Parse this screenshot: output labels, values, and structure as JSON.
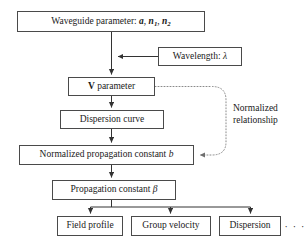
{
  "diagram": {
    "colors": {
      "background": "#ffffff",
      "border": "#4a4a4a",
      "text": "#1a1a1a",
      "edge": "#333333",
      "dotted_edge": "#8a8a8a"
    },
    "nodes": {
      "waveguide": {
        "label": "Waveguide parameter: a, n1, n2",
        "prefix": "Waveguide parameter: ",
        "sym_a": "a",
        "sym_n": "n",
        "sub1": "1",
        "sub2": "2",
        "comma": ", "
      },
      "wavelength": {
        "prefix": "Wavelength: ",
        "symbol": "λ"
      },
      "vparam": {
        "bold": "V",
        "rest": " parameter"
      },
      "dispersion_curve": {
        "label": "Dispersion curve"
      },
      "normalized_propagation": {
        "prefix": "Normalized propagation constant ",
        "symbol": "b"
      },
      "propagation_constant": {
        "prefix": "Propagation constant ",
        "symbol": "β"
      },
      "field_profile": {
        "label": "Field profile"
      },
      "group_velocity": {
        "label": "Group velocity"
      },
      "dispersion": {
        "label": "Dispersion"
      }
    },
    "annotations": {
      "normalized_relationship_line1": "Normalized",
      "normalized_relationship_line2": "relationship",
      "ellipsis": "· · ·"
    }
  }
}
